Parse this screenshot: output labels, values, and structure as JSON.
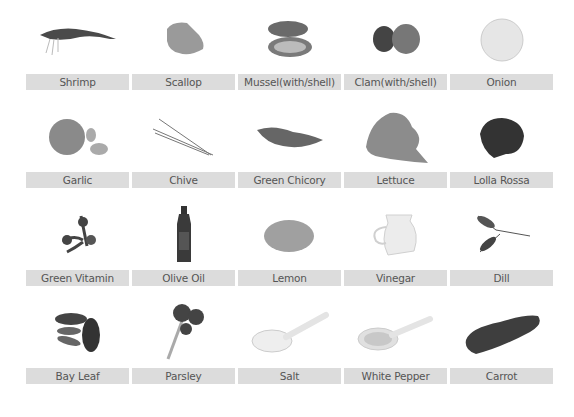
{
  "ingredients": [
    {
      "label": "Shrimp",
      "icon": "shrimp-icon"
    },
    {
      "label": "Scallop",
      "icon": "scallop-icon"
    },
    {
      "label": "Mussel(with/shell)",
      "icon": "mussel-icon"
    },
    {
      "label": "Clam(with/shell)",
      "icon": "clam-icon"
    },
    {
      "label": "Onion",
      "icon": "onion-icon"
    },
    {
      "label": "Garlic",
      "icon": "garlic-icon"
    },
    {
      "label": "Chive",
      "icon": "chive-icon"
    },
    {
      "label": "Green Chicory",
      "icon": "green-chicory-icon"
    },
    {
      "label": "Lettuce",
      "icon": "lettuce-icon"
    },
    {
      "label": "Lolla Rossa",
      "icon": "lolla-rossa-icon"
    },
    {
      "label": "Green Vitamin",
      "icon": "green-vitamin-icon"
    },
    {
      "label": "Olive Oil",
      "icon": "olive-oil-icon"
    },
    {
      "label": "Lemon",
      "icon": "lemon-icon"
    },
    {
      "label": "Vinegar",
      "icon": "vinegar-icon"
    },
    {
      "label": "Dill",
      "icon": "dill-icon"
    },
    {
      "label": "Bay Leaf",
      "icon": "bay-leaf-icon"
    },
    {
      "label": "Parsley",
      "icon": "parsley-icon"
    },
    {
      "label": "Salt",
      "icon": "salt-icon"
    },
    {
      "label": "White Pepper",
      "icon": "white-pepper-icon"
    },
    {
      "label": "Carrot",
      "icon": "carrot-icon"
    }
  ],
  "colors": {
    "label_bg": "#dcdcdc",
    "label_text": "#555555"
  }
}
